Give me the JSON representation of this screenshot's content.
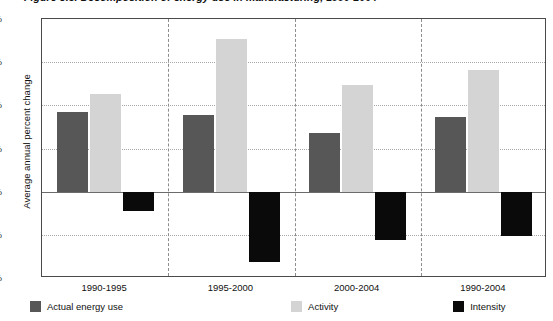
{
  "chart_data": {
    "type": "bar",
    "title": "Figure 3.5. Decomposition of energy use in manufacturing, 1990-2004",
    "subtitle": "",
    "xlabel": "",
    "ylabel": "Average annual percent change",
    "categories": [
      "1990-1995",
      "1995-2000",
      "2000-2004",
      "1990-2004"
    ],
    "series": [
      {
        "name": "Actual energy use",
        "color": "#575757",
        "values": [
          1.85,
          1.78,
          1.35,
          1.73
        ]
      },
      {
        "name": "Activity",
        "color": "#d4d4d4",
        "values": [
          2.27,
          3.53,
          2.48,
          2.82
        ]
      },
      {
        "name": "Intensity",
        "color": "#0a0a0a",
        "values": [
          -0.45,
          -1.63,
          -1.13,
          -1.02
        ]
      }
    ],
    "ylim": [
      -2,
      4
    ],
    "ytick_values": [
      4,
      3,
      2,
      1,
      0,
      -1,
      -2
    ],
    "ytick_labels": [
      "4%",
      "3%",
      "2%",
      "1%",
      "0%",
      "-1%",
      "-2%"
    ],
    "grid": true,
    "grid_axis": "y",
    "legend_position": "bottom-left",
    "zero_line": true,
    "group_separators": true
  },
  "legend": {
    "items": [
      {
        "label": "Actual energy use",
        "color": "#575757"
      },
      {
        "label": "Activity",
        "color": "#d4d4d4"
      },
      {
        "label": "Intensity",
        "color": "#0a0a0a"
      }
    ]
  }
}
